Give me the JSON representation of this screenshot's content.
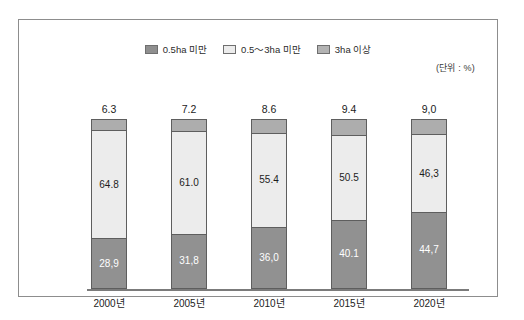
{
  "legend": {
    "items": [
      {
        "label": "0.5ha 미만",
        "swatch": "dark-gray-swatch",
        "color": "#8f8f8f"
      },
      {
        "label": "0.5～3ha 미만",
        "swatch": "light-gray-swatch",
        "color": "#ececec"
      },
      {
        "label": "3ha 이상",
        "swatch": "mid-gray-swatch",
        "color": "#b3b3b3"
      }
    ]
  },
  "unit_note": "(단위 : %)",
  "chart_data": {
    "type": "bar",
    "stacked": true,
    "stacked_normalized": true,
    "title": "",
    "subtitle": "",
    "xlabel": "",
    "ylabel": "",
    "unit": "%",
    "grid": false,
    "legend_position": "top-center",
    "ylim": [
      0,
      100
    ],
    "categories": [
      "2000년",
      "2005년",
      "2010년",
      "2015년",
      "2020년"
    ],
    "series": [
      {
        "name": "0.5ha 미만",
        "color": "#8f8f8f",
        "values": [
          28.9,
          31.8,
          36.0,
          40.1,
          44.7
        ]
      },
      {
        "name": "0.5～3ha 미만",
        "color": "#ececec",
        "values": [
          64.8,
          61.0,
          55.4,
          50.5,
          46.3
        ]
      },
      {
        "name": "3ha 이상",
        "color": "#adadad",
        "values": [
          6.3,
          7.2,
          8.6,
          9.4,
          9.0
        ]
      }
    ],
    "bars": [
      {
        "category": "2000년",
        "top_value": "6.3",
        "mid_value": "64.8",
        "bottom_value": "28,9",
        "top_pct": 6.3,
        "mid_pct": 64.8,
        "bottom_pct": 28.9
      },
      {
        "category": "2005년",
        "top_value": "7.2",
        "mid_value": "61.0",
        "bottom_value": "31,8",
        "top_pct": 7.2,
        "mid_pct": 61.0,
        "bottom_pct": 31.8
      },
      {
        "category": "2010년",
        "top_value": "8.6",
        "mid_value": "55.4",
        "bottom_value": "36,0",
        "top_pct": 8.6,
        "mid_pct": 55.4,
        "bottom_pct": 36.0
      },
      {
        "category": "2015년",
        "top_value": "9.4",
        "mid_value": "50.5",
        "bottom_value": "40.1",
        "top_pct": 9.4,
        "mid_pct": 50.5,
        "bottom_pct": 40.1
      },
      {
        "category": "2020년",
        "top_value": "9,0",
        "mid_value": "46,3",
        "bottom_value": "44,7",
        "top_pct": 9.0,
        "mid_pct": 46.3,
        "bottom_pct": 44.7
      }
    ]
  }
}
